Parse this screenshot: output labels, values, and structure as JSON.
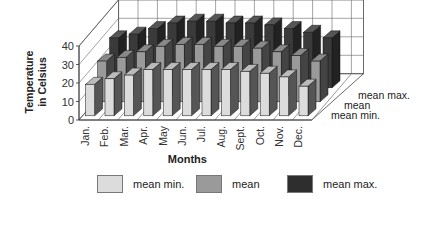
{
  "chart_data": {
    "type": "bar",
    "subtype": "3d-grouped-depth",
    "title": "",
    "xlabel": "Months",
    "ylabel": "Temperature in Celsius",
    "ylabel_lines": [
      "Temperature",
      "in Celsius"
    ],
    "ylim": [
      0,
      40
    ],
    "yticks": [
      0,
      10,
      20,
      30,
      40
    ],
    "grid": true,
    "categories": [
      "Jan.",
      "Feb.",
      "Mar.",
      "Apr.",
      "May",
      "Jun.",
      "Jul.",
      "Aug.",
      "Sept.",
      "Oct.",
      "Nov.",
      "Dec."
    ],
    "series": [
      {
        "name": "mean min.",
        "color": "#dcdcdc",
        "values": [
          17,
          20,
          22,
          25,
          25,
          25,
          25,
          25,
          24,
          23,
          21,
          16
        ]
      },
      {
        "name": "mean",
        "color": "#9a9a9a",
        "values": [
          22,
          24,
          27,
          30,
          31,
          31,
          30,
          30,
          29,
          27,
          25,
          22
        ]
      },
      {
        "name": "mean max.",
        "color": "#3a3a3a",
        "values": [
          27,
          29,
          32,
          35,
          36,
          36,
          35,
          35,
          34,
          32,
          30,
          27
        ]
      }
    ],
    "depth_axis_labels": [
      "mean min.",
      "mean",
      "mean max."
    ],
    "legend_position": "bottom"
  },
  "legend": {
    "items": [
      {
        "label": "mean min.",
        "color": "#dcdcdc"
      },
      {
        "label": "mean",
        "color": "#9a9a9a"
      },
      {
        "label": "mean max.",
        "color": "#3a3a3a"
      }
    ]
  }
}
